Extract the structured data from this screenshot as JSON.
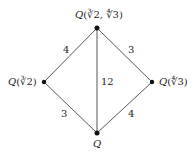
{
  "diagram": {
    "nodes": {
      "top": {
        "field": "Q",
        "args": "(∛2, ∜3)"
      },
      "left": {
        "field": "Q",
        "args": "(∛2)"
      },
      "right": {
        "field": "Q",
        "args": "(∜3)"
      },
      "bottom": {
        "field": "Q",
        "args": ""
      }
    },
    "edges": {
      "top_left": "4",
      "top_right": "3",
      "top_bottom": "12",
      "left_bottom": "3",
      "right_bottom": "4"
    }
  }
}
